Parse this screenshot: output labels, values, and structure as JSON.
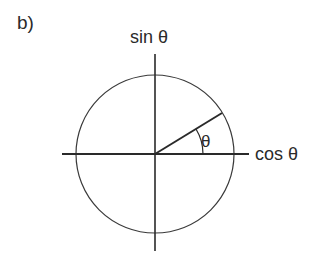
{
  "panel_label": "b)",
  "axes": {
    "vertical_label": "sin θ",
    "horizontal_label": "cos θ"
  },
  "angle_label": "θ",
  "geometry": {
    "center": [
      155,
      154
    ],
    "radius": 79,
    "angle_deg": 31,
    "stroke_color": "#333333"
  }
}
